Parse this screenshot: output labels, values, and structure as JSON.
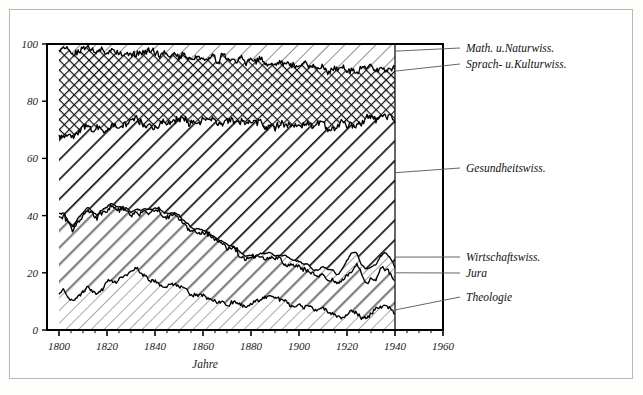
{
  "figure": {
    "background": "#ffffff",
    "frame_color": "#b9b9b4",
    "axis_color": "#000000"
  },
  "axes": {
    "x": {
      "label": "Jahre",
      "min": 1795,
      "max": 1960,
      "ticks": [
        1800,
        1820,
        1840,
        1860,
        1880,
        1900,
        1920,
        1940,
        1960
      ],
      "tick_labels": [
        "1800",
        "1820",
        "1840",
        "1860",
        "1880",
        "1900",
        "1920",
        "1940",
        "1960"
      ],
      "minor_tick_step": 5
    },
    "y": {
      "label": "",
      "min": 0,
      "max": 100,
      "ticks": [
        0,
        20,
        40,
        60,
        80,
        100
      ],
      "tick_labels": [
        "0",
        "20",
        "40",
        "60",
        "80",
        "100"
      ]
    }
  },
  "legend": {
    "position": "right",
    "items": [
      {
        "label": "Math. u.Naturwiss.",
        "pattern": "thin-diagonal-stripes"
      },
      {
        "label": "Sprach- u.Kulturwiss.",
        "pattern": "cross-hatch"
      },
      {
        "label": "Gesundheitswiss.",
        "pattern": "bold-diagonal-stripes"
      },
      {
        "label": "Wirtschaftswiss.",
        "pattern": "fine-diagonal-stripes"
      },
      {
        "label": "Jura",
        "pattern": "gray-diagonal-bands"
      },
      {
        "label": "Theologie",
        "pattern": "light-thin-diagonal"
      }
    ]
  },
  "chart_data": {
    "type": "area",
    "stacked": true,
    "normalized_percent": true,
    "title": "",
    "xlabel": "Jahre",
    "ylabel": "",
    "xlim": [
      1795,
      1960
    ],
    "ylim": [
      0,
      100
    ],
    "grid": false,
    "x": [
      1800,
      1802,
      1804,
      1806,
      1808,
      1810,
      1812,
      1814,
      1816,
      1818,
      1820,
      1822,
      1824,
      1826,
      1828,
      1830,
      1832,
      1834,
      1836,
      1838,
      1840,
      1842,
      1844,
      1846,
      1848,
      1850,
      1852,
      1854,
      1856,
      1858,
      1860,
      1862,
      1864,
      1866,
      1868,
      1870,
      1872,
      1874,
      1876,
      1878,
      1880,
      1882,
      1884,
      1886,
      1888,
      1890,
      1892,
      1894,
      1896,
      1898,
      1900,
      1902,
      1904,
      1906,
      1908,
      1910,
      1912,
      1914,
      1916,
      1918,
      1920,
      1922,
      1924,
      1926,
      1928,
      1930,
      1932,
      1934,
      1936,
      1938,
      1940
    ],
    "series": [
      {
        "name": "Theologie",
        "values": [
          14,
          13,
          11,
          10,
          12,
          13,
          15,
          14,
          13,
          14,
          16,
          17,
          17,
          18,
          19,
          20,
          21,
          20,
          19,
          18,
          17,
          16,
          15,
          16,
          17,
          16,
          15,
          14,
          13,
          12,
          12,
          11,
          11,
          10,
          10,
          9,
          9,
          9,
          9,
          8,
          9,
          10,
          11,
          12,
          12,
          11,
          11,
          10,
          10,
          9,
          9,
          8,
          8,
          7,
          7,
          7,
          6,
          6,
          5,
          5,
          6,
          7,
          6,
          5,
          5,
          6,
          7,
          8,
          9,
          8,
          6
        ]
      },
      {
        "name": "Jura",
        "values": [
          26,
          27,
          26,
          25,
          26,
          27,
          27,
          26,
          26,
          27,
          26,
          26,
          25,
          24,
          22,
          20,
          20,
          21,
          22,
          23,
          24,
          25,
          25,
          24,
          23,
          23,
          22,
          22,
          21,
          22,
          22,
          22,
          21,
          21,
          20,
          20,
          19,
          18,
          17,
          17,
          16,
          15,
          15,
          14,
          14,
          14,
          14,
          14,
          13,
          13,
          13,
          13,
          13,
          12,
          12,
          12,
          12,
          12,
          11,
          12,
          13,
          14,
          16,
          14,
          12,
          11,
          11,
          12,
          13,
          12,
          11
        ]
      },
      {
        "name": "Wirtschaftswiss.",
        "values": [
          1,
          1,
          1,
          1,
          1,
          1,
          1,
          1,
          1,
          1,
          1,
          1,
          1,
          1,
          1,
          1,
          1,
          1,
          1,
          1,
          1,
          1,
          1,
          1,
          1,
          1,
          1,
          1,
          1,
          1,
          1,
          1,
          1,
          1,
          1,
          1,
          1,
          1,
          1,
          1,
          1,
          1,
          1,
          1,
          1,
          1,
          1,
          2,
          2,
          2,
          2,
          2,
          2,
          2,
          2,
          3,
          3,
          3,
          3,
          4,
          5,
          6,
          5,
          4,
          4,
          5,
          5,
          6,
          5,
          5,
          5
        ]
      },
      {
        "name": "Gesundheitswiss.",
        "values": [
          27,
          28,
          30,
          31,
          30,
          29,
          28,
          29,
          30,
          29,
          28,
          27,
          28,
          29,
          31,
          33,
          32,
          31,
          30,
          30,
          29,
          30,
          31,
          32,
          33,
          34,
          35,
          36,
          37,
          37,
          38,
          39,
          40,
          41,
          42,
          43,
          44,
          45,
          46,
          47,
          47,
          47,
          46,
          45,
          45,
          46,
          46,
          46,
          47,
          48,
          48,
          49,
          49,
          50,
          51,
          50,
          50,
          50,
          52,
          51,
          48,
          45,
          44,
          48,
          52,
          52,
          50,
          48,
          47,
          49,
          53
        ]
      },
      {
        "name": "Sprach- u.Kulturwiss.",
        "values": [
          30,
          29,
          30,
          31,
          29,
          28,
          27,
          28,
          28,
          27,
          26,
          26,
          26,
          25,
          24,
          23,
          23,
          24,
          25,
          25,
          25,
          24,
          24,
          23,
          22,
          22,
          22,
          22,
          22,
          23,
          22,
          22,
          22,
          22,
          22,
          22,
          22,
          22,
          22,
          22,
          22,
          22,
          22,
          22,
          22,
          21,
          21,
          21,
          21,
          21,
          21,
          21,
          21,
          21,
          20,
          20,
          20,
          20,
          20,
          19,
          19,
          19,
          20,
          20,
          19,
          18,
          18,
          17,
          17,
          17,
          16
        ]
      },
      {
        "name": "Math. u.Naturwiss.",
        "values": [
          2,
          2,
          2,
          2,
          2,
          2,
          2,
          2,
          2,
          2,
          3,
          3,
          3,
          3,
          3,
          3,
          3,
          3,
          3,
          3,
          4,
          4,
          4,
          4,
          4,
          4,
          5,
          5,
          6,
          4,
          5,
          5,
          5,
          5,
          5,
          6,
          5,
          6,
          5,
          6,
          5,
          6,
          5,
          7,
          6,
          8,
          7,
          7,
          7,
          7,
          7,
          7,
          7,
          8,
          8,
          8,
          9,
          9,
          9,
          9,
          9,
          9,
          9,
          9,
          8,
          8,
          9,
          9,
          9,
          9,
          9
        ]
      }
    ]
  }
}
